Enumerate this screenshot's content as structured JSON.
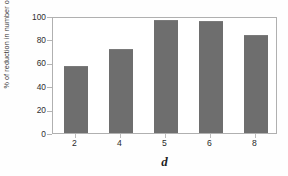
{
  "chart_data": {
    "type": "bar",
    "title": "",
    "xlabel": "d",
    "ylabel": "% of reduction in number of terms",
    "categories": [
      "2",
      "4",
      "5",
      "6",
      "8"
    ],
    "values": [
      57,
      72,
      97,
      96,
      84
    ],
    "ylim": [
      0,
      100
    ],
    "yticks": [
      "100",
      "80",
      "60",
      "40",
      "20",
      "0"
    ],
    "ytick_values": [
      100,
      80,
      60,
      40,
      20,
      0
    ],
    "grid": false,
    "legend": null,
    "bar_color": "#6e6e6e",
    "frame_color": "#b0b0b0",
    "plot_background": "#ffffff",
    "figure_background": "#fefefe"
  }
}
